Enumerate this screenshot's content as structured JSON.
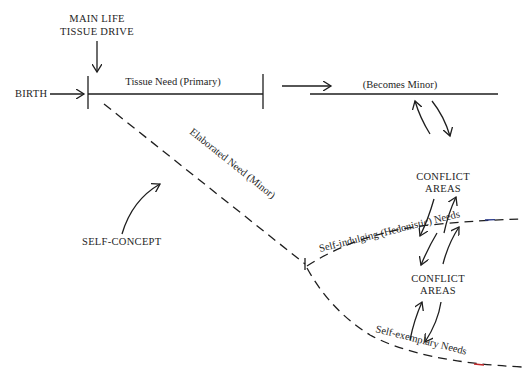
{
  "diagram": {
    "type": "flow-diagram",
    "labels": {
      "main_drive_line1": "MAIN LIFE",
      "main_drive_line2": "TISSUE DRIVE",
      "birth": "BIRTH",
      "tissue_need": "Tissue Need (Primary)",
      "becomes_minor": "(Becomes Minor)",
      "elaborated_need": "Elaborated Need (Minor)",
      "self_concept": "SELF-CONCEPT",
      "conflict_upper_line1": "CONFLICT",
      "conflict_upper_line2": "AREAS",
      "conflict_lower_line1": "CONFLICT",
      "conflict_lower_line2": "AREAS",
      "self_indulging": "Self-indulging (Hedonistic) Needs",
      "self_exemplary": "Self-exemplary Needs"
    },
    "nodes": [
      {
        "id": "main_drive",
        "text": "MAIN LIFE TISSUE DRIVE"
      },
      {
        "id": "birth",
        "text": "BIRTH"
      },
      {
        "id": "tissue_need",
        "text": "Tissue Need (Primary)",
        "line": "solid"
      },
      {
        "id": "becomes_minor",
        "text": "(Becomes Minor)",
        "line": "solid"
      },
      {
        "id": "elaborated_need",
        "text": "Elaborated Need (Minor)",
        "line": "dashed"
      },
      {
        "id": "self_concept",
        "text": "SELF-CONCEPT"
      },
      {
        "id": "conflict_upper",
        "text": "CONFLICT AREAS"
      },
      {
        "id": "self_indulging",
        "text": "Self-indulging (Hedonistic) Needs",
        "line": "dashed"
      },
      {
        "id": "conflict_lower",
        "text": "CONFLICT AREAS"
      },
      {
        "id": "self_exemplary",
        "text": "Self-exemplary Needs",
        "line": "dashed"
      }
    ],
    "edges": [
      {
        "from": "main_drive",
        "to": "tissue_need",
        "kind": "arrow"
      },
      {
        "from": "birth",
        "to": "tissue_need",
        "kind": "arrow"
      },
      {
        "from": "tissue_need",
        "to": "becomes_minor",
        "kind": "arrow"
      },
      {
        "from": "tissue_need",
        "to": "elaborated_need",
        "kind": "dashed-branch"
      },
      {
        "from": "self_concept",
        "to": "elaborated_need",
        "kind": "curved-arrow"
      },
      {
        "from": "elaborated_need",
        "to": "self_indulging",
        "kind": "dashed-branch"
      },
      {
        "from": "elaborated_need",
        "to": "self_exemplary",
        "kind": "dashed-branch"
      },
      {
        "from": "becomes_minor",
        "to": "conflict_upper",
        "kind": "bidirectional-curved"
      },
      {
        "from": "conflict_upper",
        "to": "self_indulging",
        "kind": "bidirectional-curved"
      },
      {
        "from": "self_indulging",
        "to": "conflict_lower",
        "kind": "bidirectional-curved"
      },
      {
        "from": "conflict_lower",
        "to": "self_exemplary",
        "kind": "bidirectional-curved"
      }
    ],
    "colors": {
      "ink": "#1e1e1e",
      "background": "#ffffff",
      "accent_blue_dash": "#2a3a8a",
      "accent_red_dash": "#c0282a"
    }
  }
}
